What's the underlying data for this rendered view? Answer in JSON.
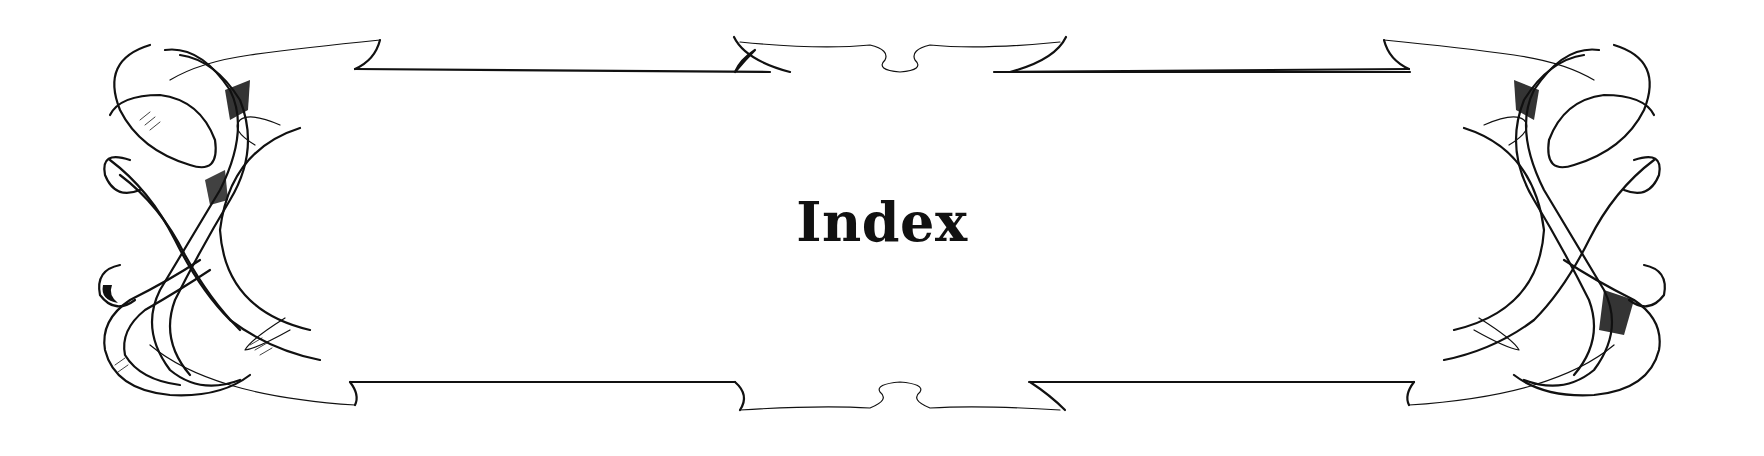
{
  "page": {
    "title": "Index"
  },
  "decoration": {
    "type": "ornamental-ribbon-frame",
    "line_color": "#111111",
    "background": "#ffffff"
  }
}
